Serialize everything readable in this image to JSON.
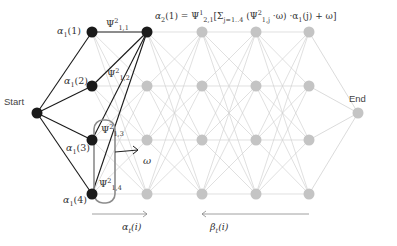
{
  "diagram": {
    "start_label": "Start",
    "end_label": "End",
    "columns_x": [
      92,
      147,
      202,
      256,
      309
    ],
    "rows_y": [
      32,
      86,
      140,
      194
    ],
    "start_node": {
      "x": 37,
      "y": 113
    },
    "end_node": {
      "x": 358,
      "y": 113
    },
    "active_color": "#1a1a1a",
    "inactive_color": "#c4c4c4",
    "inactive_edge_color": "#d2d2d2",
    "highlight_box_color": "#8c8c8c",
    "alpha_labels": [
      {
        "base": "α",
        "sub": "1",
        "arg": "(1)"
      },
      {
        "base": "α",
        "sub": "1",
        "arg": "(2)"
      },
      {
        "base": "α",
        "sub": "1",
        "arg": "(3)"
      },
      {
        "base": "α",
        "sub": "1",
        "arg": "(4)"
      }
    ],
    "psi_labels": [
      {
        "base": "Ψ",
        "sup": "2",
        "sub": "1,1"
      },
      {
        "base": "Ψ",
        "sup": "2",
        "sub": "1,2"
      },
      {
        "base": "Ψ",
        "sup": "2",
        "sub": "1,3"
      },
      {
        "base": "Ψ",
        "sup": "2",
        "sub": "1,4"
      }
    ],
    "formula": {
      "lhs": "α",
      "lhs_sub": "2",
      "lhs_arg": "(1) = Ψ",
      "psi_sup": "1",
      "psi_sub": "2,1",
      "sum_open": "[Σ",
      "sum_sub": "j=1..4",
      "inner_open": " (Ψ",
      "inner_sup": "2",
      "inner_sub": "1,j",
      "inner_rest": " ·ω) ·α",
      "alpha_sub": "1",
      "tail": "(j) + ω]"
    },
    "omega_label": "ω",
    "forward_label": {
      "base": "α",
      "sub": "t",
      "arg": "(i)"
    },
    "backward_label": {
      "base": "β",
      "sub": "t",
      "arg": "(i)"
    }
  }
}
